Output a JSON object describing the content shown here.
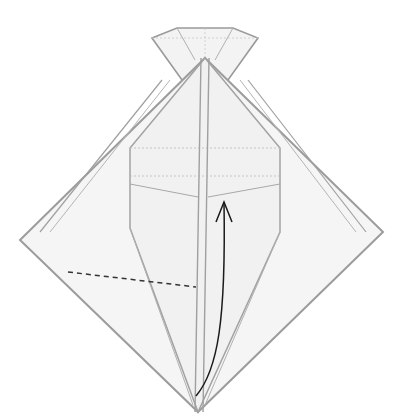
{
  "diagram": {
    "type": "origami-fold-step",
    "description": "Origami diamond base with a narrow kite-shaped flap and a small pyramid at the top; valley fold line on the left, curved arrow indicating lifting the bottom point upward",
    "colors": {
      "paper": "#f4f4f4",
      "edge": "#9a9a9a",
      "crease": "#b8b8b8",
      "fold_line": "#333333",
      "arrow": "#1a1a1a"
    },
    "symbols": [
      {
        "name": "valley-fold-line",
        "style": "dashed"
      },
      {
        "name": "fold-up-arrow",
        "style": "curved-arrow"
      }
    ]
  }
}
